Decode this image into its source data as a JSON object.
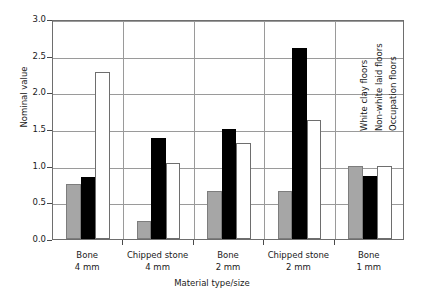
{
  "chart_data": {
    "type": "bar",
    "title": "",
    "xlabel": "Material type/size",
    "ylabel": "Nominal value",
    "ylim": [
      0.0,
      3.0
    ],
    "ytick_labels": [
      "0.0",
      "0.5",
      "1.0",
      "1.5",
      "2.0",
      "2.5",
      "3.0"
    ],
    "ytick_values": [
      0.0,
      0.5,
      1.0,
      1.5,
      2.0,
      2.5,
      3.0
    ],
    "grid": true,
    "legend_position": "in-plot-rotated-annotations",
    "categories": [
      {
        "line1": "Bone",
        "line2": "4 mm"
      },
      {
        "line1": "Chipped stone",
        "line2": "4 mm"
      },
      {
        "line1": "Bone",
        "line2": "2 mm"
      },
      {
        "line1": "Chipped stone",
        "line2": "2 mm"
      },
      {
        "line1": "Bone",
        "line2": "1 mm"
      }
    ],
    "series": [
      {
        "name": "White clay floors",
        "color": "#a6a6a6",
        "values": [
          0.75,
          0.25,
          0.66,
          0.66,
          1.0
        ]
      },
      {
        "name": "Non-white laid floors",
        "color": "#000000",
        "values": [
          0.85,
          1.38,
          1.5,
          2.6,
          0.86
        ]
      },
      {
        "name": "Occupation floors",
        "color": "#ffffff",
        "values": [
          2.28,
          1.03,
          1.31,
          1.62,
          1.0
        ]
      }
    ],
    "annotations": [
      {
        "text": "White clay floors"
      },
      {
        "text": "Non-white laid floors"
      },
      {
        "text": "Occupation floors"
      }
    ]
  }
}
